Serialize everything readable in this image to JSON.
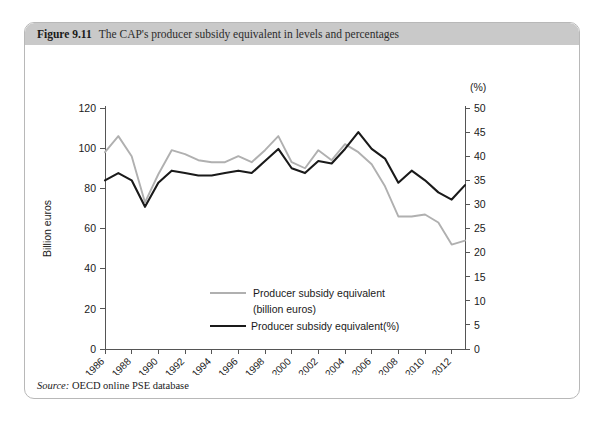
{
  "figure": {
    "number": "Figure 9.11",
    "caption": "The CAP's producer subsidy equivalent in levels and percentages",
    "source_label": "Source:",
    "source_text": "OECD online PSE database"
  },
  "chart_data": {
    "type": "line",
    "title": "The CAP's producer subsidy equivalent in levels and percentages",
    "xlabel": "",
    "ylabel": "Billion euros",
    "y2label": "(%)",
    "ylim": [
      0,
      120
    ],
    "y2lim": [
      0,
      50
    ],
    "yticks": [
      0,
      20,
      40,
      60,
      80,
      100,
      120
    ],
    "y2ticks": [
      0,
      5,
      10,
      15,
      20,
      25,
      30,
      35,
      40,
      45,
      50
    ],
    "grid": false,
    "legend_position": "center",
    "x": [
      1986,
      1987,
      1988,
      1989,
      1990,
      1991,
      1992,
      1993,
      1994,
      1995,
      1996,
      1997,
      1998,
      1999,
      2000,
      2001,
      2002,
      2003,
      2004,
      2005,
      2006,
      2007,
      2008,
      2009,
      2010,
      2011,
      2012,
      2013
    ],
    "xtick_labels": [
      "1986",
      "1988",
      "1990",
      "1992",
      "1994",
      "1996",
      "1998",
      "2000",
      "2002",
      "2004",
      "2006",
      "2008",
      "2010",
      "2012"
    ],
    "series": [
      {
        "name": "Producer subsidy equivalent (billion euros)",
        "legend_line1": "Producer subsidy equivalent",
        "legend_line2": "(billion euros)",
        "color": "#b0b0b0",
        "axis": "left",
        "unit": "billion euros",
        "values": [
          98,
          106,
          96,
          73,
          87,
          99,
          97,
          94,
          93,
          93,
          96,
          93,
          99,
          106,
          93,
          90,
          99,
          94,
          102,
          98,
          92,
          81,
          66,
          66,
          67,
          63,
          52,
          54
        ]
      },
      {
        "name": "Producer subsidy equivalent (%)",
        "legend_line1": "Producer subsidy equivalent(%)",
        "legend_line2": "",
        "color": "#1a1a1a",
        "axis": "right",
        "unit": "%",
        "values": [
          35.0,
          36.5,
          35.0,
          29.5,
          34.5,
          37.0,
          36.5,
          36.0,
          36.0,
          36.5,
          37.0,
          36.5,
          39.0,
          41.5,
          37.5,
          36.5,
          39.0,
          38.5,
          41.5,
          45.0,
          41.5,
          39.5,
          34.5,
          37.0,
          35.0,
          32.5,
          31.0,
          34.0
        ]
      }
    ]
  }
}
